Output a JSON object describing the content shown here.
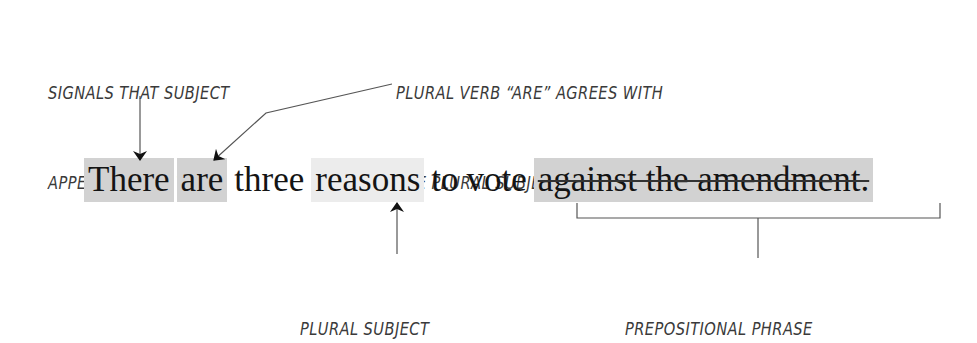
{
  "annotations": {
    "signals": {
      "line1": "SIGNALS THAT SUBJECT",
      "line2": "APPEARS AFTER VERB"
    },
    "plural_verb": {
      "line1": "PLURAL VERB “ARE” AGREES WITH",
      "line2": "THE PLURAL SUBJECT “REASONS”"
    },
    "plural_subject": "PLURAL SUBJECT",
    "prepositional_phrase": "PREPOSITIONAL PHRASE"
  },
  "sentence": {
    "words": [
      {
        "text": "There",
        "highlight": "dark"
      },
      {
        "text": "are",
        "highlight": "dark"
      },
      {
        "text": "three",
        "highlight": "none"
      },
      {
        "text": "reasons",
        "highlight": "light"
      },
      {
        "text": "to",
        "highlight": "none"
      },
      {
        "text": "vote",
        "highlight": "none"
      },
      {
        "text": "against the amendment.",
        "highlight": "dark",
        "strikethrough": true
      }
    ]
  },
  "colors": {
    "highlight_dark": "#d2d2d2",
    "highlight_light": "#ececec",
    "ink": "#3a3a3a",
    "text": "#141414"
  }
}
